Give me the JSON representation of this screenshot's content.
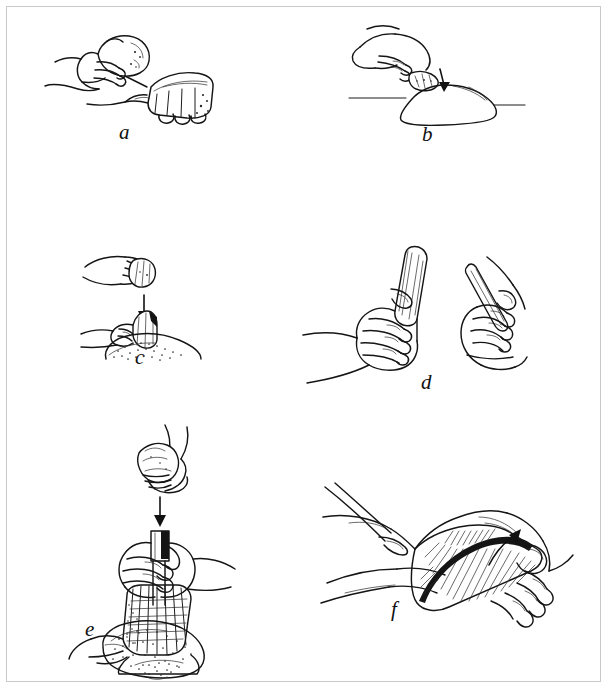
{
  "figure": {
    "type": "line-drawing-plate",
    "border_color": "#c9c9c9",
    "background_color": "#ffffff",
    "ink_color": "#151515",
    "caption": "",
    "panels": [
      {
        "id": "a",
        "label": "a",
        "technique": "hard-hammer direct freehand percussion",
        "description": "A hand holds a rounded hammerstone and strikes the edge of a core held in the other hand.",
        "elements": [
          "hammerstone",
          "striking-hand",
          "core",
          "supporting-hand"
        ]
      },
      {
        "id": "b",
        "label": "b",
        "technique": "block-on-block / anvil percussion",
        "description": "A hand drives a core downward onto a large stone anvil resting on the ground.",
        "elements": [
          "hand",
          "core",
          "anvil-stone",
          "ground-line"
        ]
      },
      {
        "id": "c",
        "label": "c",
        "technique": "bipolar percussion",
        "description": "A hammerstone in a raised fist is brought down, shown by an arrow, onto a core steadied on an anvil stone.",
        "elements": [
          "hammerstone-hand",
          "downward-arrow",
          "core",
          "holding-hand",
          "anvil-stone"
        ]
      },
      {
        "id": "d",
        "label": "d",
        "technique": "soft-hammer percussion and flake handling",
        "description": "Left: a hand grips an antler or bone billet. Right: a hand holds a detached blade or flake.",
        "elements": [
          "billet",
          "gripping-hand",
          "flake",
          "holding-hand"
        ]
      },
      {
        "id": "e",
        "label": "e",
        "technique": "indirect percussion (punch technique)",
        "description": "A hammerstone descends, shown by an arrow, onto an antler punch positioned on a prismatic blade core held against an anvil stone.",
        "elements": [
          "hammerstone-hand",
          "downward-arrow",
          "punch",
          "blade-core",
          "holding-hand",
          "anvil-stone"
        ]
      },
      {
        "id": "f",
        "label": "f",
        "technique": "pressure flaking",
        "description": "A biface rests on the palm while a pressure flaker is pushed along the edge, the direction of force shown by a curved arrow.",
        "elements": [
          "biface",
          "supporting-hand",
          "pressure-flaker",
          "pressing-hand",
          "force-arrow"
        ]
      }
    ]
  }
}
